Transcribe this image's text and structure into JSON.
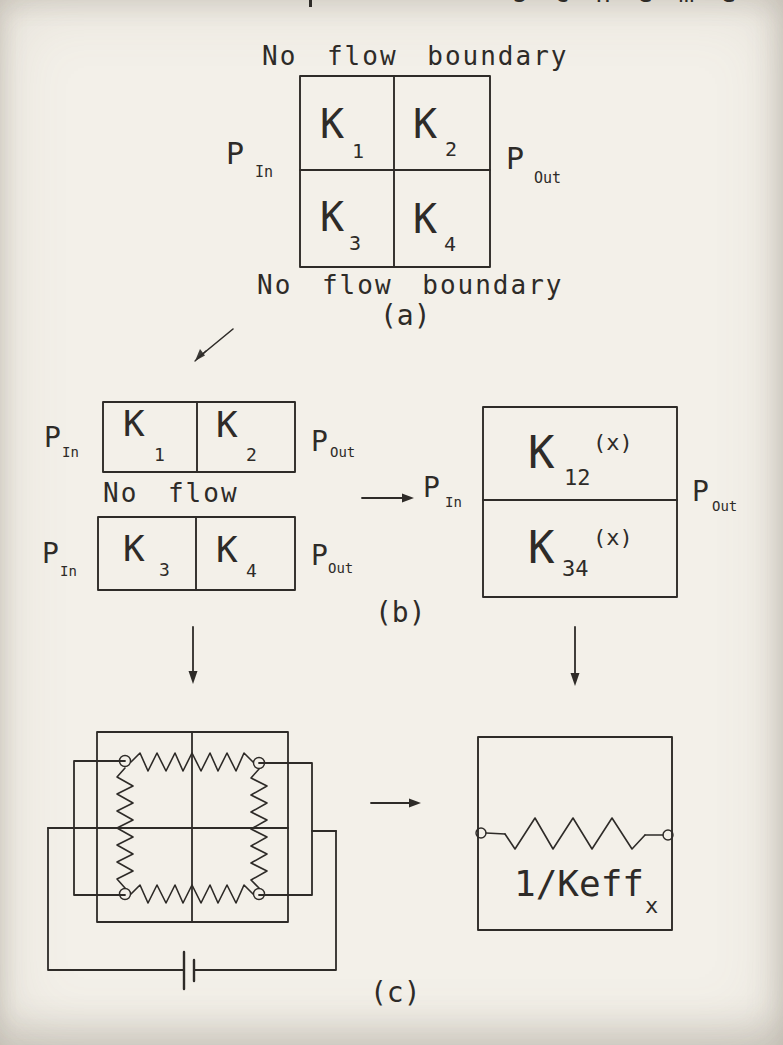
{
  "page": {
    "clipped_header_fragment": "scheme"
  },
  "colors": {
    "paper": "#f3f0e9",
    "ink": "#2e2b28"
  },
  "section_a": {
    "label": "(a)",
    "top_boundary_label": "No flow boundary",
    "bottom_boundary_label": "No flow boundary",
    "pressure_in": {
      "symbol": "P",
      "subscript": "In"
    },
    "pressure_out": {
      "symbol": "P",
      "subscript": "Out"
    },
    "cells": [
      {
        "symbol": "K",
        "subscript": "1"
      },
      {
        "symbol": "K",
        "subscript": "2"
      },
      {
        "symbol": "K",
        "subscript": "3"
      },
      {
        "symbol": "K",
        "subscript": "4"
      }
    ]
  },
  "section_b": {
    "label": "(b)",
    "no_flow_label": "No flow",
    "row1": {
      "cells": [
        {
          "symbol": "K",
          "subscript": "1"
        },
        {
          "symbol": "K",
          "subscript": "2"
        }
      ],
      "pressure_in": {
        "symbol": "P",
        "subscript": "In"
      },
      "pressure_out": {
        "symbol": "P",
        "subscript": "Out"
      }
    },
    "row2": {
      "cells": [
        {
          "symbol": "K",
          "subscript": "3"
        },
        {
          "symbol": "K",
          "subscript": "4"
        }
      ],
      "pressure_in": {
        "symbol": "P",
        "subscript": "In"
      },
      "pressure_out": {
        "symbol": "P",
        "subscript": "Out"
      }
    },
    "combined": {
      "cells": [
        {
          "symbol": "K",
          "subscript": "12",
          "superscript": "(x)"
        },
        {
          "symbol": "K",
          "subscript": "34",
          "superscript": "(x)"
        }
      ],
      "pressure_in": {
        "symbol": "P",
        "subscript": "In"
      },
      "pressure_out": {
        "symbol": "P",
        "subscript": "Out"
      }
    }
  },
  "section_c": {
    "label": "(c)",
    "equivalent_resistor_label": {
      "main": "1/Keff",
      "subscript": "x"
    }
  }
}
